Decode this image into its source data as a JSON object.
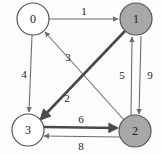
{
  "diagram": {
    "type": "directed-weighted-graph",
    "background_color": "#fdfdfd",
    "node_stroke_color": "#555555",
    "node_fill_white": "#ffffff",
    "node_fill_gray": "#a8a8a8",
    "edge_color_thin": "#6e6e6e",
    "edge_color_thick": "#4a4a4a",
    "text_color": "#1a1a1a",
    "nodes": [
      {
        "id": "n0",
        "label": "0",
        "cx": 33,
        "cy": 19,
        "r": 16,
        "fill": "#ffffff",
        "highlighted": "false"
      },
      {
        "id": "n1",
        "label": "1",
        "cx": 136,
        "cy": 19,
        "r": 16,
        "fill": "#a8a8a8",
        "highlighted": "true"
      },
      {
        "id": "n2",
        "label": "2",
        "cx": 135,
        "cy": 131,
        "r": 16,
        "fill": "#a8a8a8",
        "highlighted": "true"
      },
      {
        "id": "n3",
        "label": "3",
        "cx": 28,
        "cy": 130,
        "r": 16,
        "fill": "#ffffff",
        "highlighted": "false"
      }
    ],
    "edges": [
      {
        "id": "e01",
        "from": "0",
        "to": "1",
        "weight": "1",
        "weight_x": 84,
        "weight_y": 11,
        "thick": "false"
      },
      {
        "id": "e03",
        "from": "0",
        "to": "3",
        "weight": "4",
        "weight_x": 24,
        "weight_y": 74,
        "thick": "false"
      },
      {
        "id": "e20",
        "from": "2",
        "to": "0",
        "weight": "3",
        "weight_x": 68,
        "weight_y": 57,
        "thick": "false"
      },
      {
        "id": "e13",
        "from": "1",
        "to": "3",
        "weight": "2",
        "weight_x": 67,
        "weight_y": 98,
        "thick": "true"
      },
      {
        "id": "e21",
        "from": "2",
        "to": "1",
        "weight": "5",
        "weight_x": 122,
        "weight_y": 75,
        "thick": "false"
      },
      {
        "id": "e12",
        "from": "1",
        "to": "2",
        "weight": "9",
        "weight_x": 150,
        "weight_y": 75,
        "thick": "false"
      },
      {
        "id": "e32",
        "from": "3",
        "to": "2",
        "weight": "6",
        "weight_x": 81,
        "weight_y": 119,
        "thick": "true"
      },
      {
        "id": "e23",
        "from": "2",
        "to": "3",
        "weight": "8",
        "weight_x": 81,
        "weight_y": 146,
        "thick": "false"
      }
    ]
  }
}
